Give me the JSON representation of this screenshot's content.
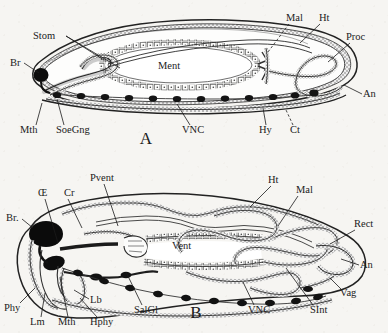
{
  "figure": {
    "background_color": "#f6f5f2",
    "ink_color": "#1b1b1b"
  },
  "panels": [
    {
      "id": "A",
      "panel_label": "A",
      "panel_label_pos": [
        146,
        144
      ],
      "description": "Diagrammatic longitudinal section, generalised gut",
      "labels": [
        {
          "name": "Stom",
          "text": "Stom",
          "x": 33,
          "y": 39,
          "anchor": "start",
          "leaders": [
            [
              [
                66,
                36
              ],
              [
                104,
                60
              ]
            ],
            [
              [
                66,
                36
              ],
              [
                120,
                68
              ]
            ]
          ]
        },
        {
          "name": "Br",
          "text": "Br",
          "x": 10,
          "y": 66,
          "anchor": "start",
          "leaders": [
            [
              [
                24,
                63
              ],
              [
                39,
                73
              ]
            ]
          ]
        },
        {
          "name": "Mth",
          "text": "Mth",
          "x": 20,
          "y": 133,
          "anchor": "start",
          "leaders": [
            [
              [
                36,
                125
              ],
              [
                42,
                103
              ]
            ]
          ]
        },
        {
          "name": "SoeGng",
          "text": "SoeGng",
          "x": 56,
          "y": 133,
          "anchor": "start",
          "leaders": [
            [
              [
                64,
                125
              ],
              [
                57,
                99
              ]
            ]
          ]
        },
        {
          "name": "VNC",
          "text": "VNC",
          "x": 182,
          "y": 133,
          "anchor": "start",
          "leaders": [
            [
              [
                190,
                125
              ],
              [
                177,
                104
              ]
            ]
          ]
        },
        {
          "name": "Hy",
          "text": "Hy",
          "x": 259,
          "y": 133,
          "anchor": "start",
          "leaders": [
            [
              [
                266,
                125
              ],
              [
                263,
                108
              ]
            ]
          ]
        },
        {
          "name": "Ct",
          "text": "Ct",
          "x": 290,
          "y": 133,
          "anchor": "start",
          "leaders": [
            [
              [
                293,
                125
              ],
              [
                286,
                110
              ]
            ]
          ],
          "dash": true
        },
        {
          "name": "Mal",
          "text": "Mal",
          "x": 286,
          "y": 21,
          "anchor": "start",
          "leaders": [
            [
              [
                289,
                24
              ],
              [
                268,
                52
              ]
            ]
          ],
          "dash": true
        },
        {
          "name": "Ht",
          "text": "Ht",
          "x": 319,
          "y": 21,
          "anchor": "start",
          "leaders": [
            [
              [
                320,
                24
              ],
              [
                300,
                43
              ]
            ]
          ]
        },
        {
          "name": "Proc",
          "text": "Proc",
          "x": 346,
          "y": 40,
          "anchor": "start",
          "leaders": [
            [
              [
                350,
                43
              ],
              [
                328,
                62
              ]
            ]
          ]
        },
        {
          "name": "An",
          "text": "An",
          "x": 363,
          "y": 97,
          "anchor": "start",
          "leaders": [
            [
              [
                362,
                94
              ],
              [
                344,
                85
              ]
            ]
          ]
        },
        {
          "name": "Ment",
          "text": "Ment",
          "x": 158,
          "y": 69,
          "anchor": "start",
          "leaders": []
        }
      ]
    },
    {
      "id": "B",
      "panel_label": "B",
      "panel_label_pos": [
        196,
        318
      ],
      "description": "Longitudinal section, detailed alimentary canal",
      "labels": [
        {
          "name": "Pvent",
          "text": "Pvent",
          "x": 90,
          "y": 181,
          "anchor": "start",
          "leaders": [
            [
              [
                104,
                184
              ],
              [
                118,
                226
              ]
            ]
          ]
        },
        {
          "name": "Oe",
          "text": "Œ",
          "x": 38,
          "y": 196,
          "anchor": "start",
          "leaders": [
            [
              [
                45,
                199
              ],
              [
                58,
                243
              ]
            ]
          ]
        },
        {
          "name": "Cr",
          "text": "Cr",
          "x": 64,
          "y": 196,
          "anchor": "start",
          "leaders": [
            [
              [
                68,
                199
              ],
              [
                82,
                228
              ]
            ]
          ]
        },
        {
          "name": "Br",
          "text": "Br.",
          "x": 6,
          "y": 221,
          "anchor": "start",
          "leaders": [
            [
              [
                22,
                219
              ],
              [
                33,
                228
              ]
            ]
          ]
        },
        {
          "name": "Phy",
          "text": "Phy",
          "x": 4,
          "y": 311,
          "anchor": "start",
          "leaders": [
            [
              [
                20,
                303
              ],
              [
                35,
                288
              ]
            ]
          ]
        },
        {
          "name": "Lm",
          "text": "Lm",
          "x": 30,
          "y": 325,
          "anchor": "start",
          "leaders": [
            [
              [
                41,
                317
              ],
              [
                45,
                293
              ]
            ]
          ]
        },
        {
          "name": "Mth",
          "text": "Mth",
          "x": 58,
          "y": 325,
          "anchor": "start",
          "leaders": [
            [
              [
                68,
                317
              ],
              [
                60,
                277
              ]
            ]
          ]
        },
        {
          "name": "Hphy",
          "text": "Hphy",
          "x": 90,
          "y": 325,
          "anchor": "start",
          "leaders": [
            [
              [
                97,
                317
              ],
              [
                80,
                298
              ]
            ]
          ]
        },
        {
          "name": "Lb",
          "text": "Lb",
          "x": 90,
          "y": 303,
          "anchor": "start",
          "leaders": [
            [
              [
                89,
                299
              ],
              [
                74,
                290
              ]
            ]
          ]
        },
        {
          "name": "SalGl",
          "text": "SalGl",
          "x": 134,
          "y": 313,
          "anchor": "start",
          "leaders": [
            [
              [
                142,
                305
              ],
              [
                126,
                272
              ]
            ]
          ]
        },
        {
          "name": "VNC",
          "text": "VNC",
          "x": 248,
          "y": 313,
          "anchor": "start",
          "leaders": [
            [
              [
                254,
                305
              ],
              [
                243,
                282
              ]
            ]
          ]
        },
        {
          "name": "SInt",
          "text": "SInt",
          "x": 310,
          "y": 313,
          "anchor": "start",
          "leaders": [
            [
              [
                313,
                305
              ],
              [
                286,
                268
              ]
            ]
          ]
        },
        {
          "name": "Vent",
          "text": "Vent",
          "x": 172,
          "y": 249,
          "anchor": "start",
          "leaders": []
        },
        {
          "name": "Ht",
          "text": "Ht",
          "x": 268,
          "y": 183,
          "anchor": "start",
          "leaders": [
            [
              [
                271,
                186
              ],
              [
                250,
                207
              ]
            ]
          ]
        },
        {
          "name": "Mal",
          "text": "Mal",
          "x": 296,
          "y": 193,
          "anchor": "start",
          "leaders": [
            [
              [
                298,
                196
              ],
              [
                278,
                226
              ]
            ]
          ]
        },
        {
          "name": "Rect",
          "text": "Rect",
          "x": 354,
          "y": 227,
          "anchor": "start",
          "leaders": [
            [
              [
                355,
                230
              ],
              [
                330,
                244
              ]
            ]
          ]
        },
        {
          "name": "An",
          "text": "An",
          "x": 360,
          "y": 268,
          "anchor": "start",
          "leaders": [
            [
              [
                359,
                265
              ],
              [
                341,
                259
              ]
            ]
          ]
        },
        {
          "name": "Vag",
          "text": "Vag",
          "x": 340,
          "y": 296,
          "anchor": "start",
          "leaders": [
            [
              [
                342,
                290
              ],
              [
                330,
                278
              ]
            ]
          ]
        }
      ]
    }
  ],
  "abbreviations": {
    "An": "Anus",
    "Br": "Brain",
    "Cr": "Crop",
    "Ct": "Cuticle",
    "Hphy": "Hypopharynx",
    "Ht": "Heart",
    "Hy": "Hypodermis",
    "Lb": "Labium",
    "Lm": "Labrum",
    "Mal": "Malpighian tubules",
    "Ment": "Mesenteron",
    "Mth": "Mouth",
    "Oe": "Oesophagus",
    "Phy": "Pharynx",
    "Proc": "Proctodaeum",
    "Pvent": "Proventriculus",
    "Rect": "Rectum",
    "SalGl": "Salivary gland",
    "SInt": "Small intestine",
    "SoeGng": "Suboesophageal ganglion",
    "Stom": "Stomodaeum",
    "Vag": "Vagina",
    "Vent": "Ventriculus",
    "VNC": "Ventral nerve cord"
  }
}
